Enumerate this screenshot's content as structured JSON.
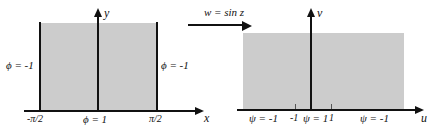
{
  "figure": {
    "title": "",
    "fill_color": "#cccccc",
    "stroke_color": "#111111",
    "background": "#ffffff"
  },
  "mapping": {
    "label": "w = sin z",
    "arrow_icon": "arrow-right-icon"
  },
  "left_plane": {
    "horizontal_axis_name": "x",
    "vertical_axis_name": "y",
    "boundary_left_label": "ϕ = -1",
    "boundary_right_label": "ϕ = -1",
    "base_label": "ϕ = 1",
    "tick_left_label": "-π/2",
    "tick_right_label": "π/2"
  },
  "right_plane": {
    "horizontal_axis_name": "u",
    "vertical_axis_name": "v",
    "axis_labels": [
      {
        "text": "ψ = -1"
      },
      {
        "text": "-1"
      },
      {
        "text": "ψ = 1"
      },
      {
        "text": "1"
      },
      {
        "text": "ψ = -1"
      }
    ]
  }
}
